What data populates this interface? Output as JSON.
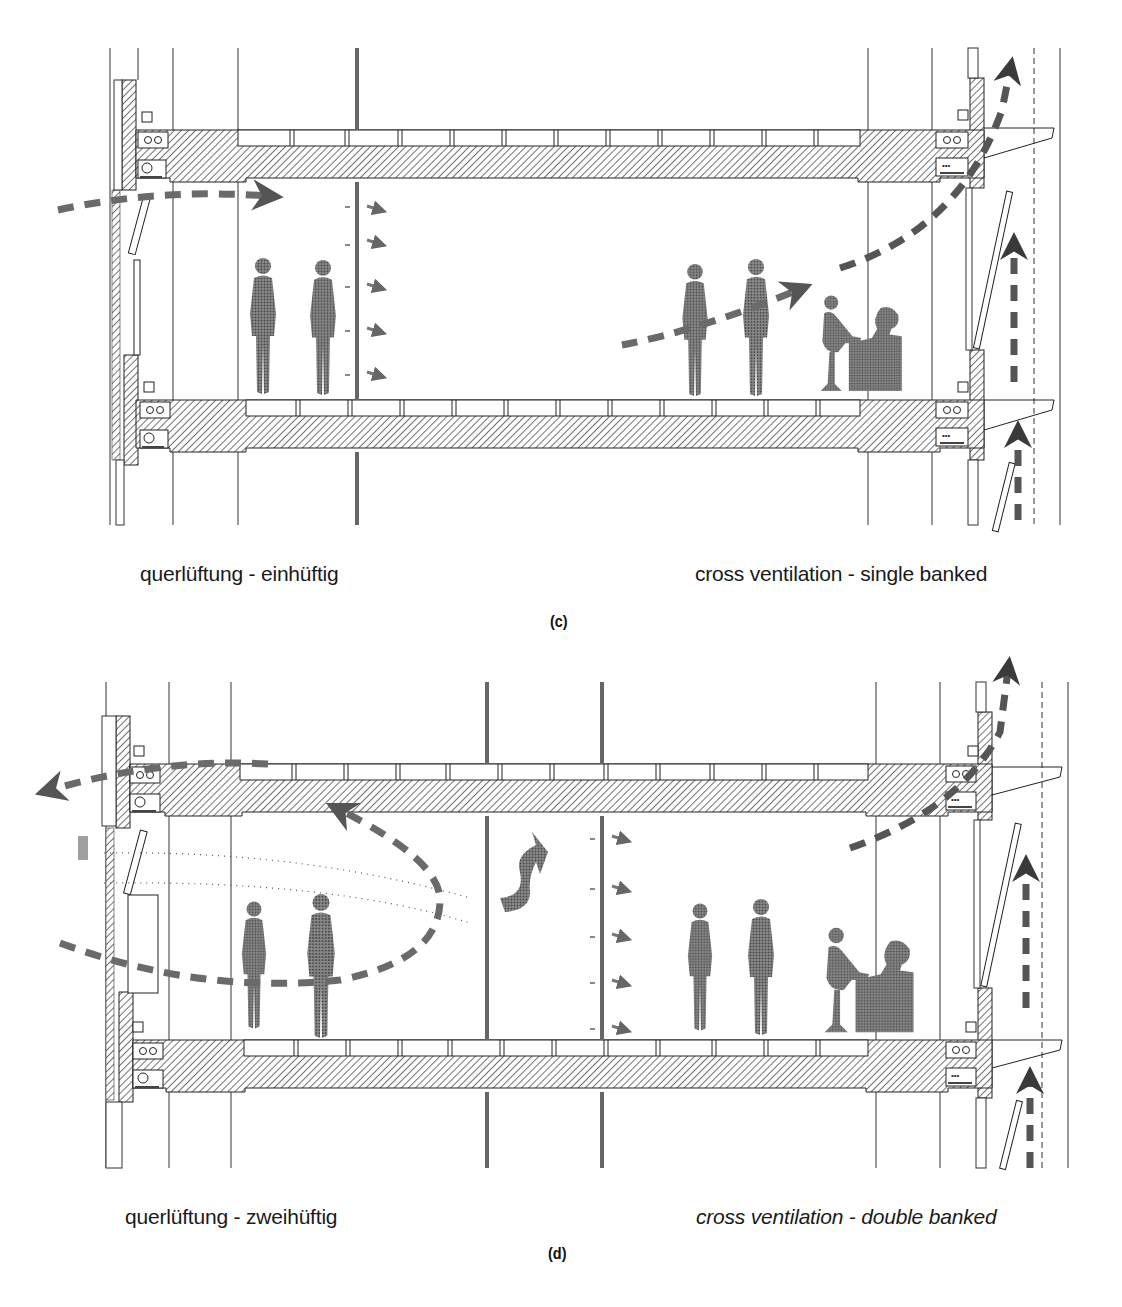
{
  "figures": [
    {
      "id": "c",
      "label": "(c)",
      "caption_de": "querlüftung - einhüftig",
      "caption_en": "cross ventilation - single banked",
      "caption_en_style": "normal",
      "elements": {
        "slabs": 2,
        "people_standing": 4,
        "people_seated_at_desk": 1,
        "interior_partition": "single perforated partition with 5 small airflow arrows",
        "airflow": [
          "inflow arrow through left facade window",
          "diagonal arrow rising to right facade",
          "vertical upward arrows in right double-facade cavity"
        ]
      }
    },
    {
      "id": "d",
      "label": "(d)",
      "caption_de": "querlüftung - zweihüftig",
      "caption_en": "cross ventilation - double banked",
      "caption_en_style": "italic",
      "elements": {
        "slabs": 2,
        "people_standing": 4,
        "people_seated_at_desk": 1,
        "interior_partition": "two partitions (corridor) with 5 small airflow arrows",
        "airflow": [
          "looping return arrow on left room exiting left facade",
          "wavy arrow through corridor",
          "diagonal arrow rising to right facade",
          "vertical upward arrows in right double-facade cavity"
        ]
      }
    }
  ],
  "colors": {
    "ink": "#1a1a1a",
    "hatch": "#3a3a3a",
    "figure_fill": "#6e6e6e",
    "arrow": "#555555",
    "background": "#ffffff"
  }
}
